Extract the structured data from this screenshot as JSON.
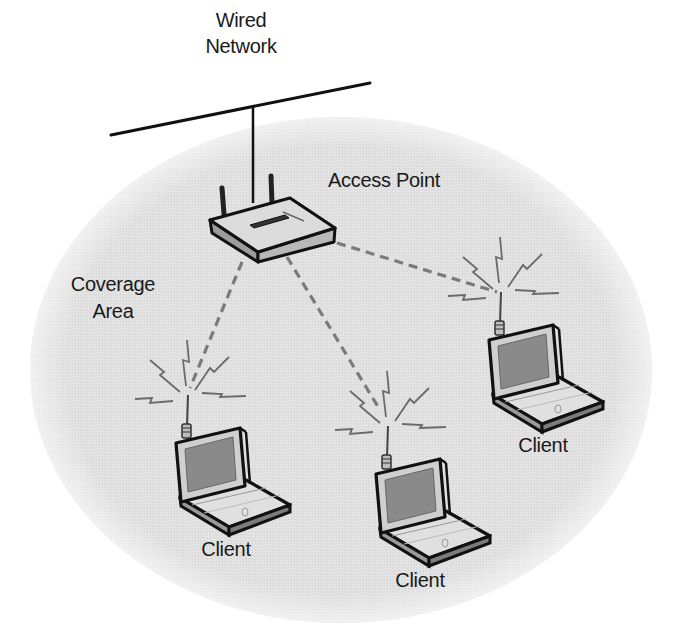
{
  "diagram": {
    "wired_network": {
      "label_line1": "Wired",
      "label_line2": "Network"
    },
    "access_point": {
      "label": "Access Point",
      "icon": "wireless-router-icon"
    },
    "coverage_area": {
      "label_line1": "Coverage",
      "label_line2": "Area",
      "fill": "#e2e2e2"
    },
    "clients": [
      {
        "label": "Client",
        "icon": "laptop-icon",
        "position": "lower-left"
      },
      {
        "label": "Client",
        "icon": "laptop-icon",
        "position": "lower-center"
      },
      {
        "label": "Client",
        "icon": "laptop-icon",
        "position": "right"
      }
    ],
    "links": [
      {
        "from": "Access Point",
        "to": "Client (lower-left)",
        "style": "dashed-wireless"
      },
      {
        "from": "Access Point",
        "to": "Client (lower-center)",
        "style": "dashed-wireless"
      },
      {
        "from": "Access Point",
        "to": "Client (right)",
        "style": "dashed-wireless"
      },
      {
        "from": "Wired Network",
        "to": "Access Point",
        "style": "solid-wired"
      }
    ],
    "colors": {
      "coverage_fill": "#e2e2e2",
      "outline": "#111111",
      "dashed_link": "#7a7a7a",
      "laptop_body": "#d9d9d9",
      "laptop_screen": "#8a8a8a"
    }
  }
}
